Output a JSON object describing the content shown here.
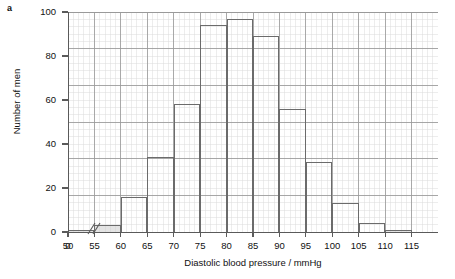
{
  "panel": {
    "letter": "a"
  },
  "chart_data": {
    "type": "bar",
    "title": "",
    "subtitle": "",
    "xlabel": "Diastolic blood pressure / mmHg",
    "ylabel": "Number of men",
    "categories": [
      "50-55",
      "55-60",
      "60-65",
      "65-70",
      "70-75",
      "75-80",
      "80-85",
      "85-90",
      "90-95",
      "95-100",
      "100-105",
      "105-110",
      "110-115"
    ],
    "bin_starts": [
      50,
      55,
      60,
      65,
      70,
      75,
      80,
      85,
      90,
      95,
      100,
      105,
      110
    ],
    "bin_width": 5,
    "values": [
      1,
      3,
      16,
      34,
      58,
      94,
      97,
      89,
      56,
      32,
      13,
      4,
      1
    ],
    "xlim": [
      50,
      120
    ],
    "ylim": [
      0,
      100
    ],
    "x_ticks": [
      0,
      50,
      55,
      60,
      65,
      70,
      75,
      80,
      85,
      90,
      95,
      100,
      105,
      110,
      115
    ],
    "x_tick_labels": [
      "0",
      "50",
      "55",
      "60",
      "65",
      "70",
      "75",
      "80",
      "85",
      "90",
      "95",
      "100",
      "105",
      "110",
      "115"
    ],
    "y_ticks": [
      0,
      20,
      40,
      60,
      80,
      100
    ],
    "y_tick_labels": [
      "0",
      "20",
      "40",
      "60",
      "80",
      "100"
    ],
    "y_major_gridlines": [
      20,
      40,
      60,
      80,
      100
    ],
    "grid": true,
    "minor_grid": true,
    "legend": null,
    "legend_position": "none",
    "axis_break": {
      "present": true,
      "symbol": "//",
      "between": [
        0,
        50
      ]
    },
    "annotations": [],
    "colors": {
      "bar_edge": "#6b6b6b",
      "bar_fill": "#ffffff",
      "bar_fill_shaded": "#cdcdcd",
      "axis": "#5a5a5a",
      "major_grid": "#9a9a9a",
      "minor_grid": "#dcdcdc",
      "text": "#111111",
      "background": "#ffffff"
    }
  }
}
